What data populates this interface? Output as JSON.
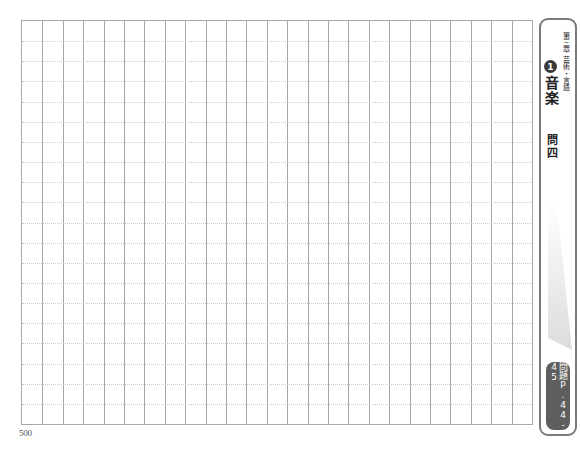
{
  "sheet": {
    "columns": 25,
    "rows": 20,
    "char_count_label": "500"
  },
  "sidebar": {
    "chapter": "第三章",
    "section_number": "1",
    "category": "芸術・言語",
    "title": "音楽",
    "question": "問四",
    "page_ref": "問題P.44-45"
  },
  "colors": {
    "grid_line": "#a5a5a5",
    "dotted_line": "#c9c9c9",
    "frame": "#7a7a7a",
    "badge": "#5e5e5e",
    "number_circle": "#3a3a3a"
  }
}
